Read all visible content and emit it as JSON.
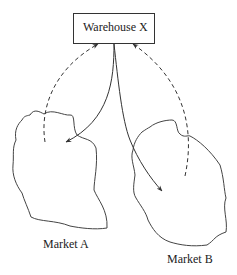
{
  "diagram": {
    "warehouse": {
      "label": "Warehouse X"
    },
    "markets": [
      {
        "label": "Market A"
      },
      {
        "label": "Market B"
      }
    ],
    "flows": [
      {
        "from": "Warehouse X",
        "to": "Market A",
        "style": "solid"
      },
      {
        "from": "Warehouse X",
        "to": "Market B",
        "style": "solid"
      },
      {
        "from": "Market A",
        "to": "Warehouse X",
        "style": "dashed"
      },
      {
        "from": "Market B",
        "to": "Warehouse X",
        "style": "dashed"
      }
    ],
    "colors": {
      "stroke": "#333333",
      "background": "#ffffff"
    }
  }
}
